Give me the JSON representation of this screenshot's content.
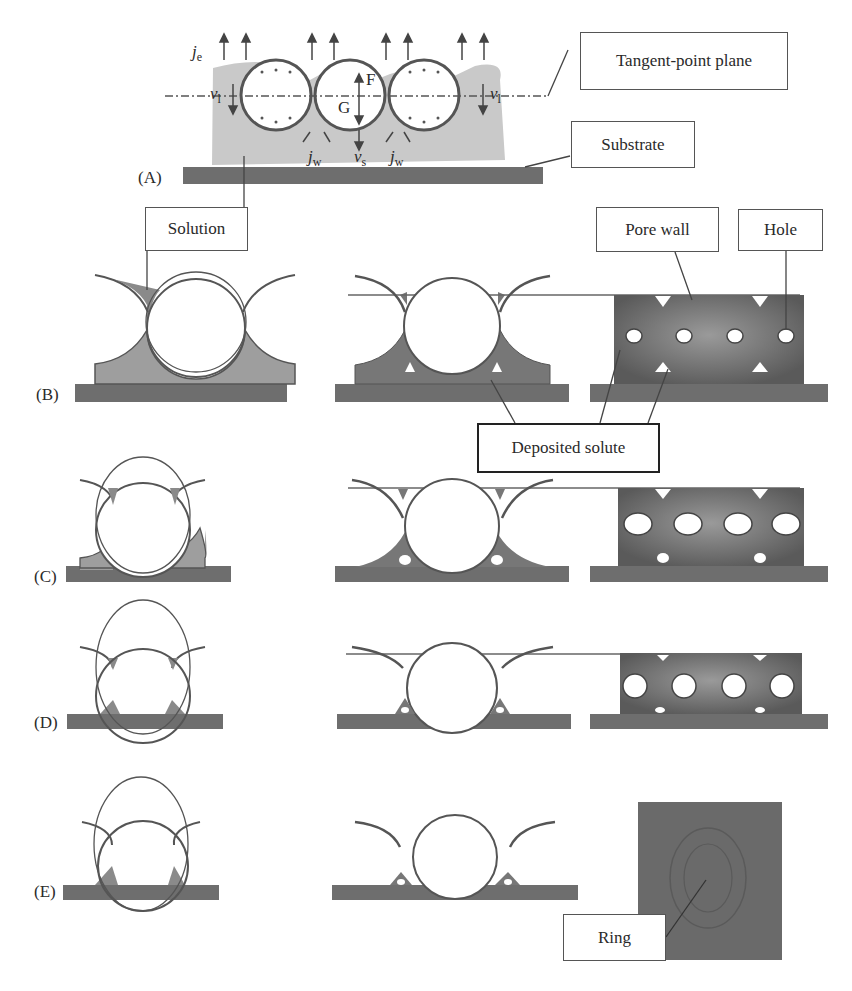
{
  "figure": {
    "panels": [
      {
        "id": "A",
        "label": "(A)"
      },
      {
        "id": "B",
        "label": "(B)"
      },
      {
        "id": "C",
        "label": "(C)"
      },
      {
        "id": "D",
        "label": "(D)"
      },
      {
        "id": "E",
        "label": "(E)"
      }
    ],
    "callouts": {
      "tangent_point_plane": "Tangent-point plane",
      "substrate": "Substrate",
      "solution": "Solution",
      "pore_wall": "Pore wall",
      "hole": "Hole",
      "deposited_solute": "Deposited solute",
      "ring": "Ring"
    },
    "symbols": {
      "je": {
        "main": "j",
        "sub": "e"
      },
      "vl_left": {
        "main": "ν",
        "sub": "l"
      },
      "vl_right": {
        "main": "ν",
        "sub": "l"
      },
      "F": "F",
      "G": "G",
      "jw_left": {
        "main": "j",
        "sub": "w"
      },
      "vs": {
        "main": "ν",
        "sub": "s"
      },
      "jw_right": {
        "main": "j",
        "sub": "w"
      }
    },
    "colors": {
      "substrate": "#6e6e6e",
      "solution": "#c8c8c8",
      "solute": "#7a7a7a",
      "pore": "#5e5e5e",
      "outline": "#555555"
    }
  }
}
